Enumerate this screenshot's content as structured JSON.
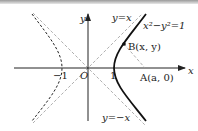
{
  "figure": {
    "curve_label": "x²−y²=1",
    "asymptote_pos_label": "y=x",
    "asymptote_neg_label": "y=−x",
    "axis_x_label": "x",
    "axis_y_label": "y",
    "origin_label": "O",
    "tick_pos_label": "1",
    "tick_neg_label": "−1",
    "point_b_label": "B(x, y)",
    "point_a_label": "A(a, 0)",
    "colors": {
      "ink": "#222222",
      "dash": "#9a9a9a",
      "curve": "#111111"
    }
  }
}
